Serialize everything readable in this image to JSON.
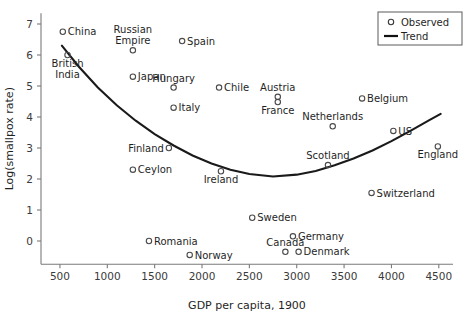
{
  "chart_data": {
    "type": "scatter",
    "title": "",
    "xlabel": "GDP per capita, 1900",
    "ylabel": "Log(smallpox rate)",
    "xlim": [
      300,
      4650
    ],
    "ylim": [
      -0.75,
      7.35
    ],
    "xticks": [
      500,
      1000,
      1500,
      2000,
      2500,
      3000,
      3500,
      4000,
      4500
    ],
    "yticks": [
      0,
      1,
      2,
      3,
      4,
      5,
      6,
      7
    ],
    "grid": false,
    "legend_position": "top-right",
    "legend": [
      {
        "label": "Observed",
        "marker": "open-circle"
      },
      {
        "label": "Trend",
        "marker": "line"
      }
    ],
    "points": [
      {
        "name": "China",
        "x": 530,
        "y": 6.75,
        "label_pos": "right"
      },
      {
        "name": "British India",
        "x": 580,
        "y": 6.0,
        "label_pos": "below"
      },
      {
        "name": "Russian Empire",
        "x": 1270,
        "y": 6.15,
        "label_pos": "above"
      },
      {
        "name": "Spain",
        "x": 1790,
        "y": 6.45,
        "label_pos": "right"
      },
      {
        "name": "Japan",
        "x": 1270,
        "y": 5.3,
        "label_pos": "right"
      },
      {
        "name": "Hungary",
        "x": 1700,
        "y": 4.95,
        "label_pos": "above"
      },
      {
        "name": "Chile",
        "x": 2180,
        "y": 4.95,
        "label_pos": "right"
      },
      {
        "name": "Austria",
        "x": 2800,
        "y": 4.65,
        "label_pos": "above"
      },
      {
        "name": "France",
        "x": 2800,
        "y": 4.48,
        "label_pos": "below"
      },
      {
        "name": "Belgium",
        "x": 3690,
        "y": 4.6,
        "label_pos": "right"
      },
      {
        "name": "Italy",
        "x": 1700,
        "y": 4.3,
        "label_pos": "right"
      },
      {
        "name": "Netherlands",
        "x": 3380,
        "y": 3.7,
        "label_pos": "above"
      },
      {
        "name": "US",
        "x": 4020,
        "y": 3.55,
        "label_pos": "right"
      },
      {
        "name": "Finland",
        "x": 1650,
        "y": 3.0,
        "label_pos": "left"
      },
      {
        "name": "England",
        "x": 4490,
        "y": 3.05,
        "label_pos": "below"
      },
      {
        "name": "Scotland",
        "x": 3330,
        "y": 2.45,
        "label_pos": "above"
      },
      {
        "name": "Ceylon",
        "x": 1270,
        "y": 2.3,
        "label_pos": "right"
      },
      {
        "name": "Ireland",
        "x": 2200,
        "y": 2.25,
        "label_pos": "below"
      },
      {
        "name": "Switzerland",
        "x": 3790,
        "y": 1.55,
        "label_pos": "right"
      },
      {
        "name": "Sweden",
        "x": 2530,
        "y": 0.75,
        "label_pos": "right"
      },
      {
        "name": "Germany",
        "x": 2960,
        "y": 0.15,
        "label_pos": "right"
      },
      {
        "name": "Romania",
        "x": 1440,
        "y": 0.0,
        "label_pos": "right"
      },
      {
        "name": "Canada",
        "x": 2880,
        "y": -0.35,
        "label_pos": "above"
      },
      {
        "name": "Denmark",
        "x": 3020,
        "y": -0.35,
        "label_pos": "right"
      },
      {
        "name": "Norway",
        "x": 1870,
        "y": -0.45,
        "label_pos": "right"
      }
    ],
    "trend": {
      "name": "Trend",
      "description": "U-shaped quadratic fit, minimum near GDP 2750",
      "x": [
        520,
        700,
        900,
        1100,
        1300,
        1500,
        1700,
        1900,
        2100,
        2300,
        2500,
        2750,
        3000,
        3200,
        3400,
        3600,
        3800,
        4000,
        4200,
        4400,
        4520
      ],
      "y": [
        6.3,
        5.62,
        4.95,
        4.38,
        3.88,
        3.45,
        3.08,
        2.76,
        2.5,
        2.3,
        2.16,
        2.08,
        2.14,
        2.26,
        2.44,
        2.66,
        2.92,
        3.22,
        3.55,
        3.9,
        4.1
      ]
    }
  }
}
